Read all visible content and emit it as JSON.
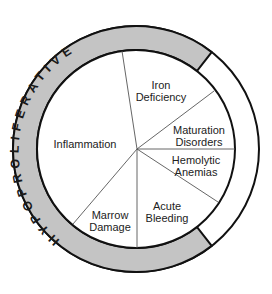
{
  "diagram": {
    "ring_label": "HYPOPROLIFERATIVE",
    "colors": {
      "ring_fill": "#c4c4c4",
      "stroke": "#111111",
      "background": "#ffffff",
      "spoke": "#555555"
    },
    "segments": [
      {
        "id": "inflammation",
        "line1": "Inflammation",
        "line2": ""
      },
      {
        "id": "iron-deficiency",
        "line1": "Iron",
        "line2": "Deficiency"
      },
      {
        "id": "maturation-disorders",
        "line1": "Maturation",
        "line2": "Disorders"
      },
      {
        "id": "hemolytic-anemias",
        "line1": "Hemolytic",
        "line2": "Anemias"
      },
      {
        "id": "acute-bleeding",
        "line1": "Acute",
        "line2": "Bleeding"
      },
      {
        "id": "marrow-damage",
        "line1": "Marrow",
        "line2": "Damage"
      }
    ]
  }
}
